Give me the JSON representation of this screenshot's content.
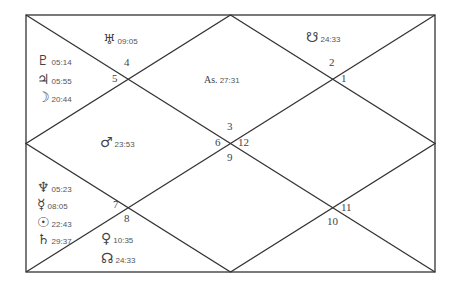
{
  "chart": {
    "style": "North Indian birth chart",
    "line_color": "#333333",
    "ascendant": {
      "label": "As.",
      "degree": "27:31"
    },
    "houses": {
      "h1": "1",
      "h2": "2",
      "h3": "3",
      "h4": "4",
      "h5": "5",
      "h6": "6",
      "h7": "7",
      "h8": "8",
      "h9": "9",
      "h10": "10",
      "h11": "11",
      "h12": "12"
    },
    "planets": {
      "uranus": {
        "glyph": "♅",
        "degree": "09:05"
      },
      "ketu": {
        "glyph": "☋",
        "degree": "24:33"
      },
      "pluto": {
        "glyph": "♇",
        "degree": "05:14"
      },
      "jupiter": {
        "glyph": "♃",
        "degree": "05:55"
      },
      "moon": {
        "glyph": "☽",
        "degree": "20:44"
      },
      "mars": {
        "glyph": "♂",
        "degree": "23:53"
      },
      "neptune": {
        "glyph": "♆",
        "degree": "05:23"
      },
      "mercury": {
        "glyph": "☿",
        "degree": "08:05"
      },
      "sun": {
        "glyph": "☉",
        "degree": "22:43"
      },
      "saturn": {
        "glyph": "♄",
        "degree": "29:37"
      },
      "venus": {
        "glyph": "♀",
        "degree": "10:35"
      },
      "rahu": {
        "glyph": "☊",
        "degree": "24:33"
      }
    }
  }
}
